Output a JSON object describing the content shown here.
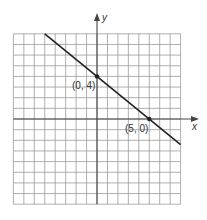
{
  "chart_data": {
    "type": "line",
    "title": "",
    "xlabel": "x",
    "ylabel": "y",
    "xlim": [
      -8,
      8
    ],
    "ylim": [
      -8,
      8
    ],
    "grid": true,
    "series": [
      {
        "name": "line",
        "equation": "y = -4/5 x + 4",
        "x": [
          -5,
          8
        ],
        "y": [
          8,
          -2.4
        ]
      }
    ],
    "points": [
      {
        "x": 0,
        "y": 4,
        "label": "(0, 4)"
      },
      {
        "x": 5,
        "y": 0,
        "label": "(5, 0)"
      }
    ],
    "colors": {
      "grid": "#9a9a9a",
      "axis": "#444444",
      "line": "#222222"
    }
  },
  "labels": {
    "x_axis": "x",
    "y_axis": "y",
    "point_a": "(0, 4)",
    "point_b": "(5, 0)"
  }
}
